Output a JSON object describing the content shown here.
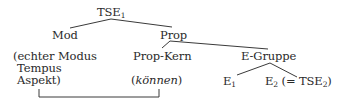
{
  "diagram": {
    "type": "syntax-tree",
    "root": {
      "label": "TSE",
      "subscript": "1"
    },
    "level1": {
      "mod": {
        "label": "Mod"
      },
      "prop": {
        "label": "Prop"
      }
    },
    "level2": {
      "mod_children": {
        "line1": "(echter Modus",
        "line2": "Tempus",
        "line3": "Aspekt)"
      },
      "prop_kern": {
        "label": "Prop-Kern",
        "example_open": "(",
        "example": "können",
        "example_close": ")"
      },
      "e_gruppe": {
        "label": "E-Gruppe"
      }
    },
    "level3": {
      "e1": {
        "label": "E",
        "subscript": "1"
      },
      "e2": {
        "label": "E",
        "subscript": "2",
        "equals_prefix": " (= TSE",
        "equals_subscript": "2",
        "equals_suffix": ")"
      }
    },
    "bracket": {
      "connects": [
        "Aspekt)",
        "(können)"
      ]
    },
    "line_color": "#3a3a3a",
    "text_color": "#2a2a2a"
  }
}
